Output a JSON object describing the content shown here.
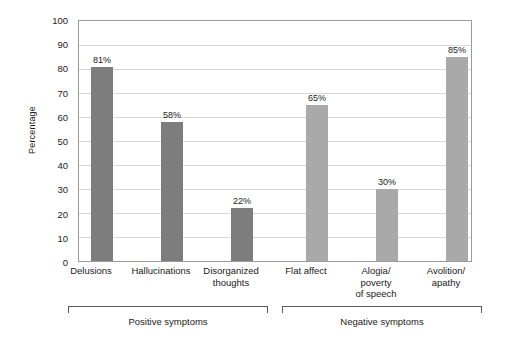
{
  "chart_data": {
    "type": "bar",
    "title": "",
    "xlabel": "",
    "ylabel": "Percentage",
    "ylim": [
      0,
      100
    ],
    "ytick_step": 10,
    "yticks": [
      0,
      10,
      20,
      30,
      40,
      50,
      60,
      70,
      80,
      90,
      100
    ],
    "grid": true,
    "legend": "none",
    "categories": [
      "Delusions",
      "Hallucinations",
      "Disorganized\nthoughts",
      "Flat affect",
      "Alogia/\npoverty\nof speech",
      "Avolition/\napathy"
    ],
    "values": [
      81,
      58,
      22,
      65,
      30,
      85
    ],
    "value_labels": [
      "81%",
      "58%",
      "22%",
      "65%",
      "30%",
      "85%"
    ],
    "bar_colors": [
      "#7d7d7d",
      "#7d7d7d",
      "#7d7d7d",
      "#a9a9a9",
      "#a9a9a9",
      "#a9a9a9"
    ],
    "groups": [
      {
        "label": "Positive symptoms",
        "categories": [
          "Delusions",
          "Hallucinations",
          "Disorganized thoughts"
        ]
      },
      {
        "label": "Negative symptoms",
        "categories": [
          "Flat affect",
          "Alogia/poverty of speech",
          "Avolition/apathy"
        ]
      }
    ]
  },
  "axis": {
    "y_title": "Percentage",
    "tick_0": "0",
    "tick_10": "10",
    "tick_20": "20",
    "tick_30": "30",
    "tick_40": "40",
    "tick_50": "50",
    "tick_60": "60",
    "tick_70": "70",
    "tick_80": "80",
    "tick_90": "90",
    "tick_100": "100"
  },
  "bars": [
    {
      "label_line1": "Delusions",
      "label_line2": "",
      "value_label": "81%"
    },
    {
      "label_line1": "Hallucinations",
      "label_line2": "",
      "value_label": "58%"
    },
    {
      "label_line1": "Disorganized",
      "label_line2": "thoughts",
      "value_label": "22%"
    },
    {
      "label_line1": "Flat affect",
      "label_line2": "",
      "value_label": "65%"
    },
    {
      "label_line1": "Alogia/",
      "label_line2": "poverty",
      "label_line3": "of speech",
      "value_label": "30%"
    },
    {
      "label_line1": "Avolition/",
      "label_line2": "apathy",
      "value_label": "85%"
    }
  ],
  "groups": {
    "positive_label": "Positive symptoms",
    "negative_label": "Negative symptoms"
  },
  "colors": {
    "bar_dark": "#7d7d7d",
    "bar_light": "#a9a9a9",
    "gridline": "#d8d8d8",
    "frame": "#9a9a9a",
    "bracket": "#5a5a5a",
    "text": "#1a1a1a",
    "background": "#ffffff"
  }
}
